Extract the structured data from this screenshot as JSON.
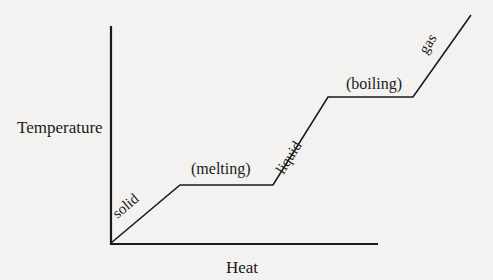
{
  "diagram": {
    "y_axis_label": "Temperature",
    "x_axis_label": "Heat",
    "segments": [
      {
        "label": "solid",
        "type": "rising"
      },
      {
        "label": "(melting)",
        "type": "plateau"
      },
      {
        "label": "liquid",
        "type": "rising"
      },
      {
        "label": "(boiling)",
        "type": "plateau"
      },
      {
        "label": "gas",
        "type": "rising"
      }
    ],
    "line_color": "#1a1a1a",
    "background_color": "#f3f2f0"
  }
}
